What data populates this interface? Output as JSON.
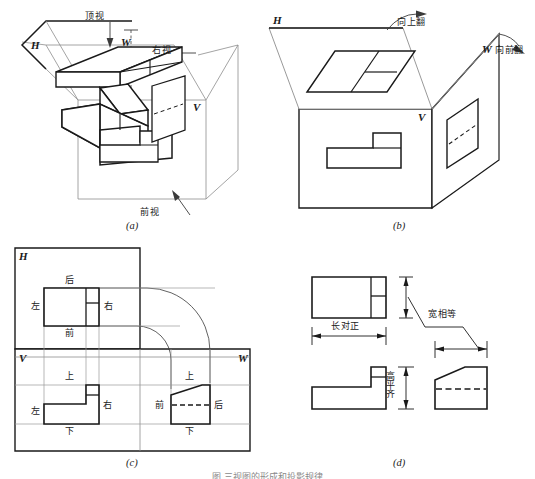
{
  "figure": {
    "caption": "图  三视图的形成和投影规律",
    "colors": {
      "ink": "#1a1a1a",
      "thin_line": "#9a9a9a",
      "paper": "#ffffff"
    }
  },
  "panels": [
    {
      "id": "a",
      "caption": "(a)",
      "description": "三投影面体系与物体的三个投射方向",
      "plane_labels": [
        {
          "name": "h-plane-label",
          "text": "H"
        },
        {
          "name": "v-plane-label",
          "text": "V"
        },
        {
          "name": "w-plane-label",
          "text": "W"
        }
      ],
      "direction_labels": [
        {
          "name": "top-view-direction",
          "text": "顶视"
        },
        {
          "name": "right-view-direction",
          "text": "右视"
        },
        {
          "name": "front-view-direction",
          "text": "前视"
        }
      ]
    },
    {
      "id": "b",
      "caption": "(b)",
      "description": "投影面展开：H面向上翻，W面向前翻",
      "plane_labels": [
        {
          "name": "h-plane-label",
          "text": "H"
        },
        {
          "name": "v-plane-label",
          "text": "V"
        },
        {
          "name": "w-plane-label",
          "text": "W"
        }
      ],
      "fold_labels": [
        {
          "name": "fold-up-label",
          "text": "向上翻"
        },
        {
          "name": "fold-forward-label",
          "text": "向前翻"
        }
      ]
    },
    {
      "id": "c",
      "caption": "(c)",
      "description": "展开后的三视图与方位关系",
      "plane_labels": [
        {
          "name": "h-plane-label",
          "text": "H"
        },
        {
          "name": "v-plane-label",
          "text": "V"
        },
        {
          "name": "w-plane-label",
          "text": "W"
        }
      ],
      "top_view_orientation": {
        "top": "后",
        "left": "左",
        "right": "右",
        "bottom": "前"
      },
      "front_view_orientation": {
        "top": "上",
        "left": "左",
        "right": "右",
        "bottom": "下"
      },
      "side_view_orientation": {
        "top": "上",
        "left": "前",
        "right": "后",
        "bottom": "下"
      }
    },
    {
      "id": "d",
      "caption": "(d)",
      "description": "三视图之间的投影规律",
      "rules": [
        {
          "name": "length-rule",
          "text": "长对正"
        },
        {
          "name": "height-rule",
          "text": "高平齐"
        },
        {
          "name": "width-rule",
          "text": "宽相等"
        }
      ]
    }
  ]
}
